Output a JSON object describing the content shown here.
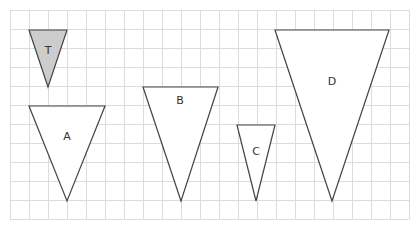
{
  "grid": {
    "x0": 10,
    "y0": 10,
    "cell": 19,
    "cols": 21,
    "rows": 11,
    "line_color": "#dcdcdc"
  },
  "shapes": [
    {
      "id": "T",
      "label": "T",
      "points": [
        [
          29,
          30
        ],
        [
          67,
          30
        ],
        [
          48,
          87
        ]
      ],
      "fill": "#cccccc",
      "label_pos": [
        48,
        51
      ]
    },
    {
      "id": "A",
      "label": "A",
      "points": [
        [
          29,
          106
        ],
        [
          105,
          106
        ],
        [
          67,
          201
        ]
      ],
      "fill": "#ffffff",
      "label_pos": [
        67,
        137
      ]
    },
    {
      "id": "B",
      "label": "B",
      "points": [
        [
          143,
          87
        ],
        [
          218,
          87
        ],
        [
          181,
          201
        ]
      ],
      "fill": "#ffffff",
      "label_pos": [
        180,
        101
      ]
    },
    {
      "id": "C",
      "label": "C",
      "points": [
        [
          237,
          125
        ],
        [
          275,
          125
        ],
        [
          256,
          201
        ]
      ],
      "fill": "#ffffff",
      "label_pos": [
        256,
        152
      ]
    },
    {
      "id": "D",
      "label": "D",
      "points": [
        [
          275,
          30
        ],
        [
          389,
          30
        ],
        [
          332,
          201
        ]
      ],
      "fill": "#ffffff",
      "label_pos": [
        332,
        82
      ]
    }
  ],
  "stroke_color": "#444444"
}
